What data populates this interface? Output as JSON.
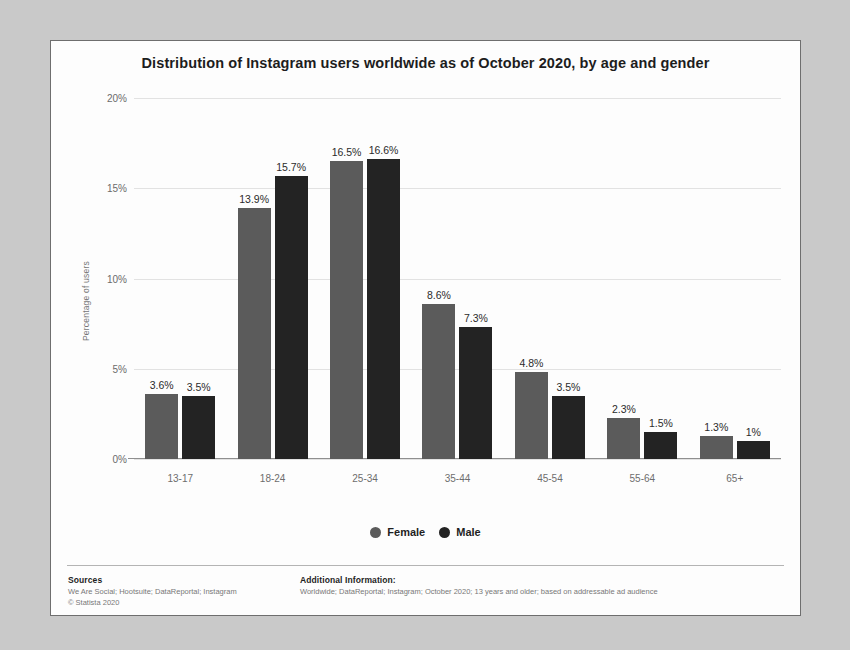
{
  "chart_data": {
    "type": "bar",
    "title": "Distribution of Instagram users worldwide as of October 2020, by age and gender",
    "xlabel": "",
    "ylabel": "Percentage of users",
    "categories": [
      "13-17",
      "18-24",
      "25-34",
      "35-44",
      "45-54",
      "55-64",
      "65+"
    ],
    "series": [
      {
        "name": "Female",
        "color": "#5b5b5b",
        "values": [
          3.6,
          13.9,
          16.5,
          8.6,
          4.8,
          2.3,
          1.3
        ],
        "labels": [
          "3.6%",
          "13.9%",
          "16.5%",
          "8.6%",
          "4.8%",
          "2.3%",
          "1.3%"
        ]
      },
      {
        "name": "Male",
        "color": "#232323",
        "values": [
          3.5,
          15.7,
          16.6,
          7.3,
          3.5,
          1.5,
          1.0
        ],
        "labels": [
          "3.5%",
          "15.7%",
          "16.6%",
          "7.3%",
          "3.5%",
          "1.5%",
          "1%"
        ]
      }
    ],
    "ylim": [
      0,
      20
    ],
    "yticks": [
      0,
      5,
      10,
      15,
      20
    ],
    "ytick_labels": [
      "0%",
      "5%",
      "10%",
      "15%",
      "20%"
    ],
    "grid": true,
    "legend_position": "bottom"
  },
  "footer": {
    "sources_heading": "Sources",
    "sources_line1": "We Are Social; Hootsuite; DataReportal; Instagram",
    "sources_line2": "© Statista 2020",
    "additional_heading": "Additional Information:",
    "additional_line": "Worldwide; DataReportal; Instagram; October 2020; 13 years and older; based on addressable ad audience"
  }
}
